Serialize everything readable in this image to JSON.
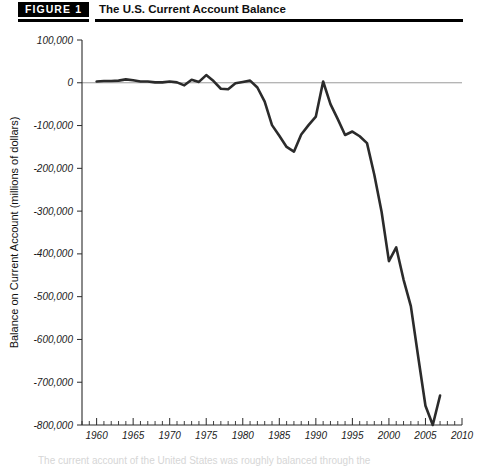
{
  "header": {
    "badge": "FIGURE 1",
    "title": "The U.S. Current Account Balance"
  },
  "caption": {
    "fragment": "The current account of the United States was roughly balanced through the"
  },
  "chart_data": {
    "type": "line",
    "title": "The U.S. Current Account Balance",
    "xlabel": "Year",
    "ylabel": "Balance on Current Account (millions of dollars)",
    "xlim": [
      1958,
      2010
    ],
    "ylim": [
      -800000,
      100000
    ],
    "grid": false,
    "legend": null,
    "x_ticks": [
      1960,
      1965,
      1970,
      1975,
      1980,
      1985,
      1990,
      1995,
      2000,
      2005,
      2010
    ],
    "x_tick_labels": [
      "1960",
      "1965",
      "1970",
      "1975",
      "1980",
      "1985",
      "1990",
      "1995",
      "2000",
      "2005",
      "2010"
    ],
    "x_minor_tick_step": 1,
    "y_ticks": [
      100000,
      0,
      -100000,
      -200000,
      -300000,
      -400000,
      -500000,
      -600000,
      -700000,
      -800000
    ],
    "y_tick_labels": [
      "100,000",
      "0",
      "-100,000",
      "-200,000",
      "-300,000",
      "-400,000",
      "-500,000",
      "-600,000",
      "-700,000",
      "-800,000"
    ],
    "zero_reference_line": 0,
    "series": [
      {
        "name": "Balance on Current Account",
        "color": "#2b2b2b",
        "x": [
          1960,
          1961,
          1962,
          1963,
          1964,
          1965,
          1966,
          1967,
          1968,
          1969,
          1970,
          1971,
          1972,
          1973,
          1974,
          1975,
          1976,
          1977,
          1978,
          1979,
          1980,
          1981,
          1982,
          1983,
          1984,
          1985,
          1986,
          1987,
          1988,
          1989,
          1990,
          1991,
          1992,
          1993,
          1994,
          1995,
          1996,
          1997,
          1998,
          1999,
          2000,
          2001,
          2002,
          2003,
          2004,
          2005,
          2006,
          2007
        ],
        "values": [
          3000,
          4000,
          4000,
          5000,
          8000,
          6000,
          3000,
          3000,
          1000,
          1000,
          3000,
          1000,
          -6000,
          7000,
          2000,
          18000,
          4000,
          -14000,
          -15000,
          -1000,
          2000,
          5000,
          -11000,
          -44000,
          -99000,
          -124000,
          -150000,
          -161000,
          -121000,
          -99000,
          -79000,
          3000,
          -50000,
          -85000,
          -122000,
          -114000,
          -125000,
          -141000,
          -215000,
          -302000,
          -417000,
          -385000,
          -460000,
          -522000,
          -640000,
          -755000,
          -800000,
          -731000
        ]
      }
    ]
  }
}
